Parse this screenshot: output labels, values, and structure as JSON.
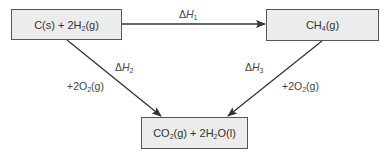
{
  "diagram": {
    "type": "hess-cycle",
    "nodes": {
      "reactants": {
        "main": "C(s) + 2H",
        "sub1": "2",
        "tail": "(g)"
      },
      "product_top": {
        "main": "CH",
        "sub1": "4",
        "tail": "(g)"
      },
      "combustion_products": {
        "part1": "CO",
        "sub1": "2",
        "part2": "(g) + 2H",
        "sub2": "2",
        "part3": "O(l)"
      }
    },
    "edges": {
      "dH1": {
        "symbol": "Δ",
        "var": "H",
        "sub": "1"
      },
      "dH2": {
        "symbol": "Δ",
        "var": "H",
        "sub": "2"
      },
      "dH3": {
        "symbol": "Δ",
        "var": "H",
        "sub": "3"
      },
      "oxygen_left": {
        "prefix": "+2O",
        "sub": "2",
        "tail": "(g)"
      },
      "oxygen_right": {
        "prefix": "+2O",
        "sub": "2",
        "tail": "(g)"
      }
    },
    "colors": {
      "box_fill": "#ececec",
      "box_border": "#555555",
      "line": "#333333"
    }
  }
}
